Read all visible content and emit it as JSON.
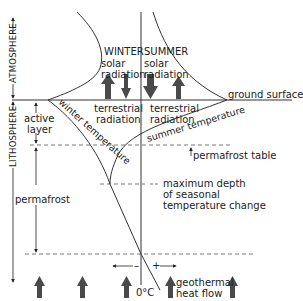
{
  "diagram": {
    "layers": {
      "atmosphere": "ATMOSPHERE",
      "lithosphere": "LITHOSPHERE"
    },
    "labels": {
      "winter_header": "WINTER",
      "winter_solar_1": "solar",
      "winter_solar_2": "radiation",
      "summer_header": "SUMMER",
      "summer_solar_1": "solar",
      "summer_solar_2": "radiation",
      "winter_terrestrial_1": "terrestrial",
      "winter_terrestrial_2": "radiation",
      "summer_terrestrial_1": "terrestrial",
      "summer_terrestrial_2": "radiation",
      "ground_surface": "ground surface",
      "active_layer_1": "active",
      "active_layer_2": "layer",
      "winter_temperature": "winter temperature",
      "summer_temperature": "summer temperature",
      "permafrost_table": "permafrost table",
      "max_depth_1": "maximum depth",
      "max_depth_2": "of seasonal",
      "max_depth_3": "temperature change",
      "permafrost": "permafrost",
      "zero_c": "0°C",
      "minus": "–",
      "plus": "+",
      "geothermal_1": "geothermal",
      "geothermal_2": "heat flow"
    },
    "colors": {
      "line": "#333333",
      "arrow_fill": "#4a4a4a",
      "dash": "#555555",
      "text": "#222222"
    }
  }
}
